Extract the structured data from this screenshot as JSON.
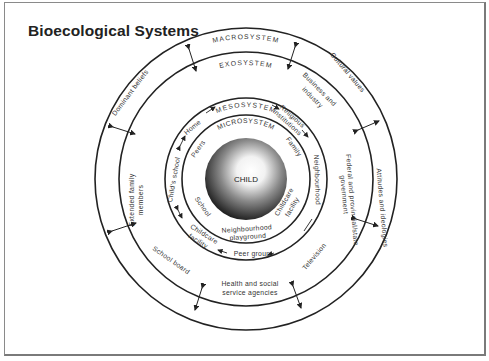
{
  "title": "Bioecological Systems",
  "systems": {
    "macro": "MACROSYSTEM",
    "exo": "EXOSYSTEM",
    "meso": "MESOSYSTEM",
    "micro": "MICROSYSTEM",
    "center": "CHILD"
  },
  "macro_items": [
    "Dominant beliefs",
    "Cultural values",
    "Attitudes and ideologies"
  ],
  "exo_items": {
    "business": [
      "Business and",
      "industry"
    ],
    "federal": [
      "Federal and provincial/state",
      "government"
    ],
    "television": "Television",
    "health": [
      "Health and social",
      "service agencies"
    ],
    "school_board": "School board",
    "extended": [
      "Extended family",
      "members"
    ]
  },
  "meso_items": {
    "home": "Home",
    "religious": [
      "Religious",
      "institutions"
    ],
    "neighbourhood": "Neighbourhood",
    "peer_group": "Peer group",
    "childcare": [
      "Childcare",
      "facility"
    ],
    "childs_school": "Child's school"
  },
  "micro_items": {
    "peers": "Peers",
    "family": "Family",
    "childcare": [
      "Childcare",
      "facility"
    ],
    "neighbourhood": [
      "Neighbourhood",
      "playground"
    ],
    "school": "School"
  },
  "colors": {
    "line": "#222222",
    "text": "#333333",
    "sphere_dark": "#1a1a1a",
    "sphere_light": "#ffffff"
  }
}
